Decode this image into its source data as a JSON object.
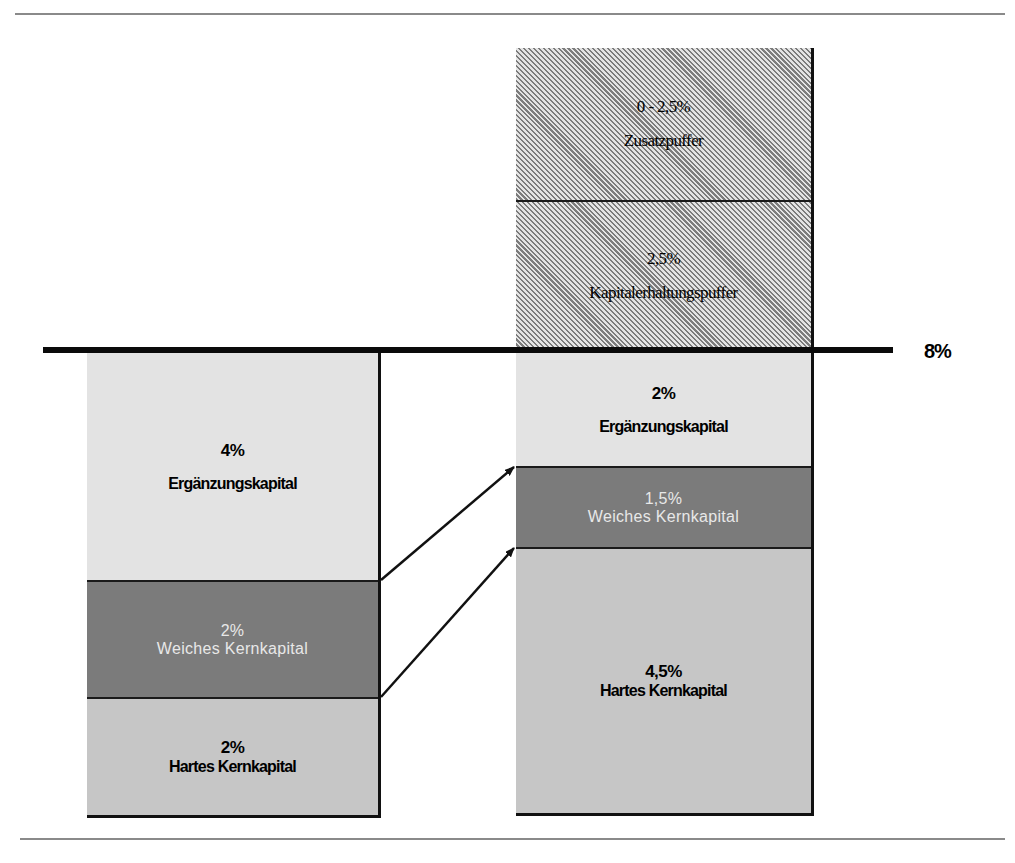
{
  "threshold": {
    "label": "8%"
  },
  "left_column": {
    "segments": [
      {
        "id": "erg",
        "pct": "4%",
        "label": "Ergänzungskapital"
      },
      {
        "id": "weich",
        "pct": "2%",
        "label": "Weiches Kernkapital"
      },
      {
        "id": "hart",
        "pct": "2%",
        "label": "Hartes Kernkapital"
      }
    ]
  },
  "right_column": {
    "segments": [
      {
        "id": "zusatz",
        "pct": "0 - 2,5%",
        "label": "Zusatzpuffer"
      },
      {
        "id": "kapitalerhaltung",
        "pct": "2,5%",
        "label": "Kapitalerhaltungspuffer"
      },
      {
        "id": "erg",
        "pct": "2%",
        "label": "Ergänzungskapital"
      },
      {
        "id": "weich",
        "pct": "1,5%",
        "label": "Weiches Kernkapital"
      },
      {
        "id": "hart",
        "pct": "4,5%",
        "label": "Hartes Kernkapital"
      }
    ]
  },
  "colors": {
    "ergaenzung": "#e3e3e3",
    "weich": "#7b7b7b",
    "hart": "#c6c6c6",
    "puffer_hatch": "#7c7c7c",
    "threshold_line": "#0a0a0a"
  }
}
